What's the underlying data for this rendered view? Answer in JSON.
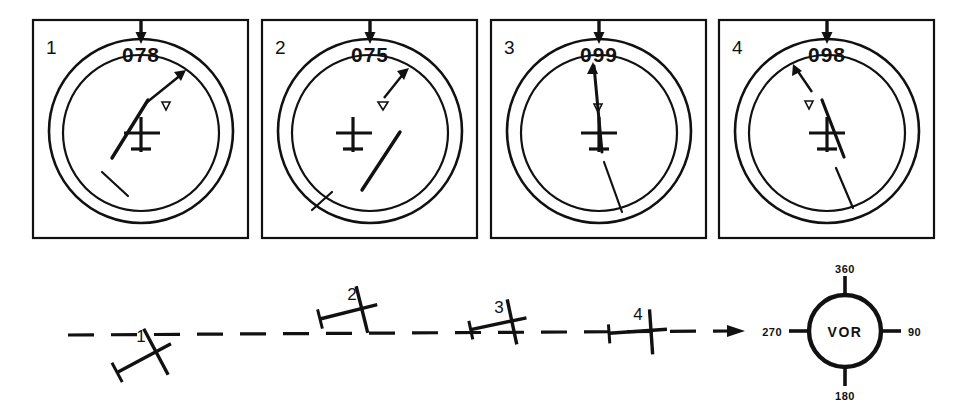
{
  "figure": {
    "stroke_color": "#111111",
    "background_color": "#ffffff"
  },
  "instrument_panels": [
    {
      "number": "1",
      "course_selected": "078",
      "cdi_needle_side": "left",
      "to_from_indicator": "TO",
      "x": 33,
      "y": 20,
      "w": 215,
      "h": 218
    },
    {
      "number": "2",
      "course_selected": "075",
      "cdi_needle_side": "right",
      "to_from_indicator": "TO",
      "x": 262,
      "y": 20,
      "w": 215,
      "h": 218
    },
    {
      "number": "3",
      "course_selected": "099",
      "cdi_needle_side": "center",
      "to_from_indicator": "TO",
      "x": 491,
      "y": 20,
      "w": 215,
      "h": 218
    },
    {
      "number": "4",
      "course_selected": "098",
      "cdi_needle_side": "slight-right",
      "to_from_indicator": "TO",
      "x": 719,
      "y": 20,
      "w": 215,
      "h": 218
    }
  ],
  "aircraft_positions": [
    {
      "number": "1",
      "x": 148,
      "y": 356,
      "heading_deg": 28,
      "relation_to_course": "below-course-intercepting"
    },
    {
      "number": "2",
      "x": 352,
      "y": 311,
      "heading_deg": 14,
      "relation_to_course": "above-course"
    },
    {
      "number": "3",
      "x": 494,
      "y": 320,
      "heading_deg": 12,
      "relation_to_course": "slightly-above-course"
    },
    {
      "number": "4",
      "x": 642,
      "y": 331,
      "heading_deg": 4,
      "relation_to_course": "on-course"
    }
  ],
  "course_line": {
    "label": "dashed inbound course to VOR",
    "start_x": 68,
    "end_x": 740,
    "start_y": 334,
    "end_y": 331,
    "arrow_direction": "right"
  },
  "vor_station": {
    "center_x": 845,
    "center_y": 331,
    "radius": 36,
    "label": "VOR",
    "radials": [
      {
        "label": "360",
        "bearing": 0
      },
      {
        "label": "90",
        "bearing": 90
      },
      {
        "label": "180",
        "bearing": 180
      },
      {
        "label": "270",
        "bearing": 270
      }
    ]
  }
}
